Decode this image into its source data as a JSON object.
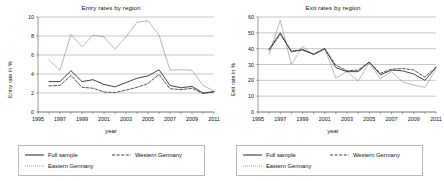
{
  "figure": {
    "background": "#ffffff",
    "panel_count": 2
  },
  "panels": [
    {
      "title": "Entry rates by region",
      "ylabel": "Entry rate in %",
      "xlabel": "year"
    },
    {
      "title": "Exit rates by region",
      "ylabel": "Exit rate in %",
      "xlabel": "year"
    }
  ],
  "legend": {
    "entries": [
      {
        "label": "Full sample",
        "style": "solid"
      },
      {
        "label": "Western Germany",
        "style": "dashed"
      },
      {
        "label": "Eastern Germany",
        "style": "dotted"
      }
    ]
  },
  "chart_data": [
    {
      "type": "line",
      "title": "Entry rates by region",
      "xlabel": "year",
      "ylabel": "Entry rate in %",
      "xlim": [
        1995,
        2011
      ],
      "ylim": [
        0,
        10
      ],
      "xticks": [
        1995,
        1997,
        1999,
        2001,
        2003,
        2005,
        2007,
        2009,
        2011
      ],
      "yticks": [
        0,
        2,
        4,
        6,
        8,
        10
      ],
      "grid": "horizontal",
      "legend_position": "below",
      "x": [
        1996,
        1997,
        1998,
        1999,
        2000,
        2001,
        2002,
        2003,
        2004,
        2005,
        2006,
        2007,
        2008,
        2009,
        2010,
        2011
      ],
      "series": [
        {
          "name": "Full sample",
          "style": "solid",
          "color": "#3a3a3a",
          "values": [
            3.2,
            3.2,
            4.35,
            3.2,
            3.4,
            2.9,
            2.65,
            3.1,
            3.55,
            3.8,
            4.45,
            2.8,
            2.55,
            2.7,
            2.0,
            2.15
          ]
        },
        {
          "name": "Western Germany",
          "style": "dashed",
          "color": "#3a3a3a",
          "values": [
            2.75,
            2.8,
            3.85,
            2.6,
            2.5,
            2.1,
            2.05,
            2.3,
            2.6,
            3.0,
            3.95,
            2.45,
            2.35,
            2.5,
            1.95,
            2.1
          ]
        },
        {
          "name": "Eastern Germany",
          "style": "dotted",
          "color": "#8a8a8a",
          "values": [
            5.45,
            4.4,
            8.15,
            6.85,
            8.1,
            7.9,
            6.6,
            7.9,
            9.45,
            9.6,
            8.1,
            4.4,
            4.45,
            4.4,
            2.8,
            2.2
          ]
        }
      ]
    },
    {
      "type": "line",
      "title": "Exit rates by region",
      "xlabel": "year",
      "ylabel": "Exit rate in %",
      "xlim": [
        1995,
        2011
      ],
      "ylim": [
        0,
        60
      ],
      "xticks": [
        1995,
        1997,
        1999,
        2001,
        2003,
        2005,
        2007,
        2009,
        2011
      ],
      "yticks": [
        0,
        10,
        20,
        30,
        40,
        50,
        60
      ],
      "grid": "horizontal",
      "legend_position": "below",
      "x": [
        1996,
        1997,
        1998,
        1999,
        2000,
        2001,
        2002,
        2003,
        2004,
        2005,
        2006,
        2007,
        2008,
        2009,
        2010,
        2011
      ],
      "series": [
        {
          "name": "Full sample",
          "style": "solid",
          "color": "#3a3a3a",
          "values": [
            39.5,
            50.0,
            38.0,
            39.5,
            36.5,
            40.0,
            28.0,
            25.5,
            25.5,
            31.5,
            23.5,
            26.5,
            26.0,
            24.0,
            20.0,
            28.0
          ]
        },
        {
          "name": "Western Germany",
          "style": "dashed",
          "color": "#3a3a3a",
          "values": [
            39.0,
            49.0,
            38.5,
            39.0,
            36.5,
            40.0,
            29.5,
            26.0,
            26.5,
            31.5,
            24.5,
            27.0,
            27.5,
            26.5,
            22.0,
            28.5
          ]
        },
        {
          "name": "Eastern Germany",
          "style": "dotted",
          "color": "#8a8a8a",
          "values": [
            36.5,
            58.0,
            30.0,
            41.5,
            36.0,
            40.0,
            21.5,
            25.5,
            19.5,
            31.0,
            21.0,
            25.5,
            19.0,
            17.0,
            15.5,
            27.0
          ]
        }
      ]
    }
  ]
}
